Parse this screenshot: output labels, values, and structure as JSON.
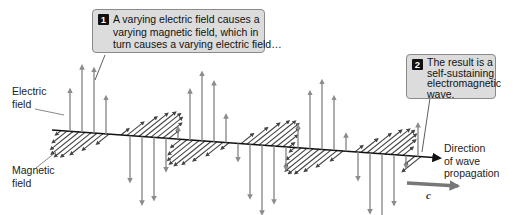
{
  "callouts": [
    {
      "number": "1",
      "lines": [
        "A varying electric field causes a",
        "varying magnetic field, which in",
        "turn causes a varying electric field…"
      ]
    },
    {
      "number": "2",
      "lines": [
        "The result is a",
        "self-sustaining",
        "electromagnetic",
        "wave."
      ]
    }
  ],
  "labels": {
    "electric_field": [
      "Electric",
      "field"
    ],
    "magnetic_field": [
      "Magnetic",
      "field"
    ],
    "direction": [
      "Direction",
      "of wave",
      "propagation"
    ],
    "speed": "c"
  },
  "colors": {
    "electric_arrow": "#8c8c8c",
    "magnetic_arrow": "#555555",
    "axis": "#111111",
    "callout_bg": "#dcdcdc",
    "speed_arrow": "#777777"
  }
}
